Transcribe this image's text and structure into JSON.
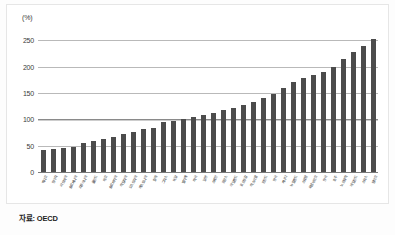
{
  "chart": {
    "unit_label": "(%)",
    "source_text": "자료: OECD",
    "bar_color": "#4c4c4c",
    "gridline_color": "#b9b9b9",
    "emphasis_gridline_color": "#8a8a8a"
  },
  "chart_data": {
    "type": "bar",
    "title": "",
    "subtitle": "",
    "xlabel": "",
    "ylabel": "(%)",
    "ylim": [
      0,
      260
    ],
    "yticks": [
      0,
      50,
      100,
      150,
      200,
      250
    ],
    "grid": true,
    "legend": null,
    "emphasis_line": 100,
    "source": "자료: OECD",
    "categories": [
      "멕시코",
      "헝가리",
      "라트비아",
      "슬로베니아",
      "리투아니아",
      "폴란드",
      "체코",
      "슬로바키아",
      "이탈리아",
      "오스트리아",
      "에스토니아",
      "칠레",
      "그리스",
      "독일",
      "벨기에",
      "미국",
      "일본",
      "스페인",
      "프랑스",
      "아일랜드",
      "포르투갈",
      "이스라엘",
      "핀란드",
      "영국",
      "캐나다",
      "뉴질랜드",
      "스웨덴",
      "룩셈부르크",
      "한국",
      "호주",
      "노르웨이",
      "네덜란드",
      "스위스",
      "덴마크"
    ],
    "values": [
      41,
      43,
      45,
      48,
      55,
      58,
      62,
      66,
      72,
      75,
      82,
      84,
      95,
      97,
      100,
      105,
      108,
      112,
      118,
      122,
      128,
      133,
      140,
      148,
      160,
      170,
      178,
      185,
      190,
      200,
      215,
      228,
      240,
      253
    ]
  }
}
